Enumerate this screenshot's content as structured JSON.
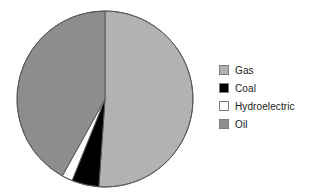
{
  "chart_data": {
    "type": "pie",
    "title": "",
    "subtitle": "",
    "xlabel": "",
    "ylabel": "",
    "legend_position": "right",
    "grid": false,
    "categories": [
      "Gas",
      "Coal",
      "Hydroelectric",
      "Oil"
    ],
    "values": [
      51,
      5,
      2,
      42
    ],
    "units": "percent",
    "start_angle_deg": 0,
    "direction": "clockwise",
    "slices": [
      {
        "label": "Gas",
        "value": 51,
        "color": "#b2b2b2",
        "start_angle_deg": 0,
        "end_angle_deg": 184
      },
      {
        "label": "Coal",
        "value": 5,
        "color": "#000000",
        "start_angle_deg": 184,
        "end_angle_deg": 202
      },
      {
        "label": "Hydroelectric",
        "value": 2,
        "color": "#ffffff",
        "start_angle_deg": 202,
        "end_angle_deg": 209
      },
      {
        "label": "Oil",
        "value": 42,
        "color": "#8d8d8d",
        "start_angle_deg": 209,
        "end_angle_deg": 360
      }
    ]
  },
  "legend": {
    "items": [
      {
        "label": "Gas",
        "color": "#b2b2b2"
      },
      {
        "label": "Coal",
        "color": "#000000"
      },
      {
        "label": "Hydroelectric",
        "color": "#ffffff"
      },
      {
        "label": "Oil",
        "color": "#8d8d8d"
      }
    ]
  },
  "geometry": {
    "center_x": 105,
    "center_y": 99,
    "radius": 88
  },
  "colors": {
    "background": "#ffffff",
    "outline": "#5a5a5a",
    "swatch_border": "#7d7d7d",
    "text": "#1a1a1a"
  }
}
